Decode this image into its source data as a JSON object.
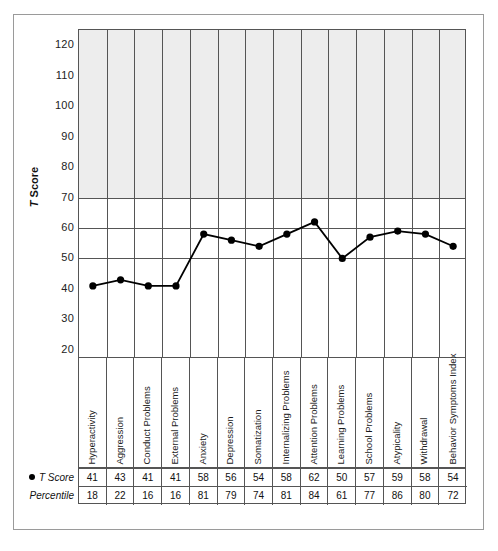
{
  "figure": {
    "frame_color": "#9a9a9a",
    "band_color": "#ededed",
    "line_color": "#000000"
  },
  "axis": {
    "title_prefix": "T",
    "title_suffix": " Score"
  },
  "table": {
    "row_labels": [
      "T Score",
      "Percentile"
    ],
    "legend_marker": "filled-circle"
  },
  "caption": {
    "text": ""
  },
  "chart_data": {
    "type": "line",
    "title": "",
    "xlabel": "",
    "ylabel": "T Score",
    "ylim": [
      17,
      125
    ],
    "yticks": [
      20,
      30,
      40,
      50,
      60,
      70,
      80,
      90,
      100,
      110,
      120
    ],
    "ytick_labels": [
      "20",
      "30",
      "40",
      "50",
      "60",
      "70",
      "80",
      "90",
      "100",
      "110",
      "120"
    ],
    "gridlines_h": [
      50,
      60,
      70
    ],
    "grid": true,
    "legend": "none",
    "shaded_region": {
      "from": 70,
      "to": 125,
      "color": "#ededed"
    },
    "categories": [
      "Hyperactivity",
      "Aggression",
      "Conduct Problems",
      "External Problems",
      "Anxiety",
      "Depression",
      "Somatization",
      "Internalizing Problems",
      "Attention Problems",
      "Learning Problems",
      "School Problems",
      "Atypicality",
      "Withdrawal",
      "Behavior Symptoms Index"
    ],
    "series": [
      {
        "name": "T Score",
        "values": [
          41,
          43,
          41,
          41,
          58,
          56,
          54,
          58,
          62,
          50,
          57,
          59,
          58,
          54
        ]
      },
      {
        "name": "Percentile",
        "values": [
          18,
          22,
          16,
          16,
          81,
          79,
          74,
          81,
          84,
          61,
          77,
          86,
          80,
          72
        ]
      }
    ]
  }
}
